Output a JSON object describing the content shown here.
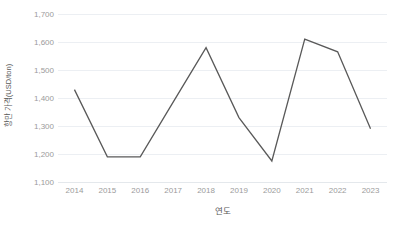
{
  "chart_data": {
    "type": "line",
    "title": "",
    "xlabel": "연도",
    "ylabel": "항만 가격(USD/ton)",
    "categories": [
      "2014",
      "2015",
      "2016",
      "2017",
      "2018",
      "2019",
      "2020",
      "2021",
      "2022",
      "2023"
    ],
    "values": [
      1430,
      1190,
      1190,
      1385,
      1580,
      1330,
      1175,
      1610,
      1565,
      1290
    ],
    "series": [
      {
        "name": "항만 가격(USD/ton)",
        "values": [
          1430,
          1190,
          1190,
          1385,
          1580,
          1330,
          1175,
          1610,
          1565,
          1290
        ]
      }
    ],
    "ylim": [
      1100,
      1700
    ],
    "yticks": [
      1100,
      1200,
      1300,
      1400,
      1500,
      1600,
      1700
    ],
    "ytick_labels": [
      "1,100",
      "1,200",
      "1,300",
      "1,400",
      "1,500",
      "1,600",
      "1,700"
    ],
    "grid": true,
    "legend": false,
    "line_color": "#595959",
    "grid_color": "#eceff3",
    "tick_label_color": "#9b9b9b",
    "axis_title_color": "#595959",
    "background": "#ffffff"
  }
}
